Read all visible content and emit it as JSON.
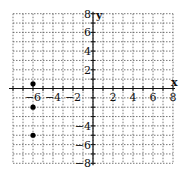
{
  "chart_data": {
    "type": "scatter",
    "title": "",
    "xlabel": "x",
    "ylabel": "y",
    "xlim": [
      -8,
      8
    ],
    "ylim": [
      -8,
      8
    ],
    "grid": true,
    "grid_style": "dotted",
    "grid_step": 1,
    "x_tick_labels": [
      "-6",
      "-4",
      "-2",
      "2",
      "4",
      "6",
      "8"
    ],
    "y_tick_labels": [
      "8",
      "6",
      "4",
      "2",
      "-4",
      "-6",
      "-8"
    ],
    "points": [
      {
        "x": -6,
        "y": 0.5
      },
      {
        "x": -6,
        "y": -2
      },
      {
        "x": -6,
        "y": -5
      }
    ],
    "colors": {
      "grid": "#555555",
      "axis": "#111111",
      "point": "#000000"
    }
  }
}
